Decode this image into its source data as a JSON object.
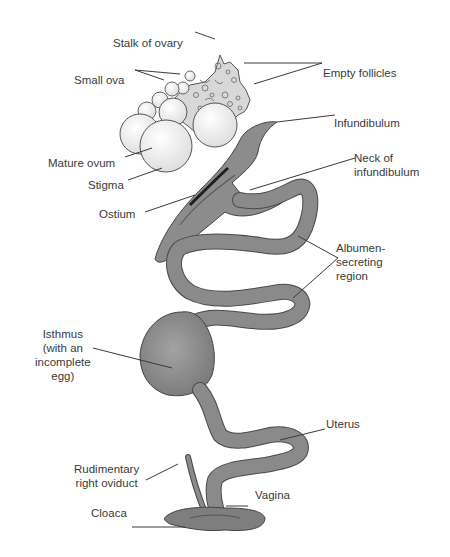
{
  "diagram": {
    "labels": {
      "stalk_of_ovary": "Stalk of ovary",
      "small_ova": "Small ova",
      "empty_follicles": "Empty follicles",
      "infundibulum": "Infundibulum",
      "mature_ovum": "Mature ovum",
      "neck_of_infundibulum": "Neck of\ninfundibulum",
      "stigma": "Stigma",
      "ostium": "Ostium",
      "albumen_secreting_region": "Albumen-\nsecreting\nregion",
      "isthmus": "Isthmus\n(with an\nincomplete\negg)",
      "uterus": "Uterus",
      "rudimentary_right_oviduct": "Rudimentary\nright oviduct",
      "vagina": "Vagina",
      "cloaca": "Cloaca"
    },
    "colors": {
      "tract_fill": "#8a8a8a",
      "tract_dark": "#5c5c5c",
      "ova_fill": "#f4f4f4",
      "ovary_fill": "#d6d6d6",
      "line": "#3a3a3a",
      "text": "#3a3a3a"
    }
  }
}
